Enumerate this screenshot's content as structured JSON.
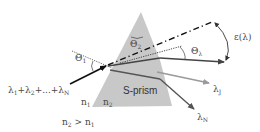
{
  "diagram": {
    "type": "optics-prism-dispersion",
    "colors": {
      "prism_fill": "#c8c8c8",
      "incident_ray": "#111111",
      "main_ray": "#444444",
      "lambda_j_ray": "#9a9a9a",
      "lambda_n_ray": "#555555",
      "text": "#4a4a4a"
    },
    "labels": {
      "input_sum": {
        "parts": [
          "λ",
          "1",
          "+λ",
          "2",
          "+...+λ",
          "N"
        ]
      },
      "n1": {
        "base": "n",
        "sub": "1"
      },
      "n2": {
        "base": "n",
        "sub": "2"
      },
      "prism": "S-prism",
      "condition": {
        "a": "n",
        "a_sub": "2",
        "op": " > n",
        "b_sub": "1"
      },
      "theta1": {
        "base": "Θ",
        "sub": "1"
      },
      "theta2": {
        "base": "Θ",
        "sub": "2"
      },
      "theta_lambda": {
        "base": "Θ",
        "sub": "λ"
      },
      "epsilon": "ε(λ)",
      "lambda_j": {
        "base": "λ",
        "sub": "J"
      },
      "lambda_n": {
        "base": "λ",
        "sub": "N"
      }
    }
  }
}
